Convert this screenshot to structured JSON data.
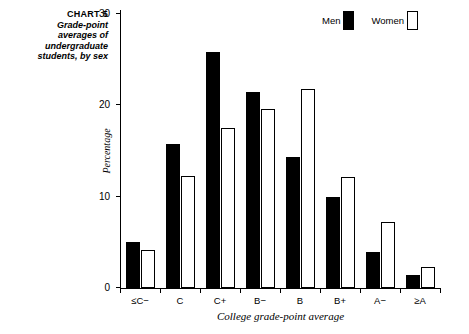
{
  "caption": {
    "chart_number": "CHART 5",
    "line1": "Grade-point",
    "line2": "averages of",
    "line3": "undergraduate",
    "line4": "students, by sex"
  },
  "legend": {
    "entries": [
      {
        "label": "Men",
        "swatch": "filled-black-square",
        "color": "#000000"
      },
      {
        "label": "Women",
        "swatch": "open-white-square",
        "color": "#ffffff"
      }
    ]
  },
  "chart_data": {
    "type": "bar",
    "title": "Grade-point averages of undergraduate students, by sex",
    "xlabel": "College grade-point average",
    "ylabel": "Percentage",
    "categories": [
      "≤C−",
      "C",
      "C+",
      "B−",
      "B",
      "B+",
      "A−",
      "≥A"
    ],
    "series": [
      {
        "name": "Men",
        "color": "#000000",
        "values": [
          5.0,
          15.8,
          25.8,
          21.5,
          14.3,
          10.0,
          3.9,
          1.4
        ]
      },
      {
        "name": "Women",
        "color": "#ffffff",
        "values": [
          4.2,
          12.3,
          17.5,
          19.6,
          21.8,
          12.2,
          7.2,
          2.3
        ]
      }
    ],
    "ylim": [
      0,
      30
    ],
    "yticks": [
      0,
      10,
      20,
      30
    ],
    "ytick_labels": [
      "0",
      "10",
      "20",
      "30"
    ],
    "grid": false,
    "legend_position": "top-right"
  }
}
